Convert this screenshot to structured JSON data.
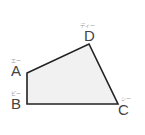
{
  "diagram": {
    "type": "quadrilateral",
    "fill": "#f1f1f1",
    "stroke": "#222222",
    "vertices": [
      {
        "name": "A",
        "ruby": "エー",
        "x": 27,
        "y": 73
      },
      {
        "name": "B",
        "ruby": "ビー",
        "x": 27,
        "y": 104
      },
      {
        "name": "C",
        "ruby": "シー",
        "x": 118,
        "y": 104
      },
      {
        "name": "D",
        "ruby": "ディー",
        "x": 89,
        "y": 44
      }
    ]
  }
}
